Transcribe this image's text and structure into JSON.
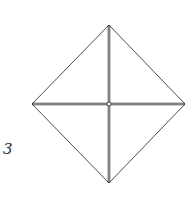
{
  "diagram": {
    "step_label": "3",
    "stroke_color": "#3a3a3a",
    "points": {
      "top": [
        109,
        25
      ],
      "left": [
        32,
        104
      ],
      "right": [
        185,
        104
      ],
      "bottom": [
        109,
        183
      ],
      "center": [
        109,
        104
      ]
    }
  }
}
